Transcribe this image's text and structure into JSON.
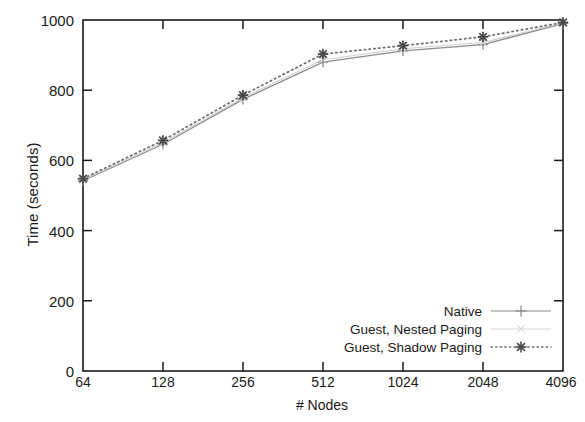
{
  "chart_data": {
    "type": "line",
    "title": "",
    "xlabel": "# Nodes",
    "ylabel": "Time (seconds)",
    "x_scale": "log2",
    "categories": [
      "64",
      "128",
      "256",
      "512",
      "1024",
      "2048",
      "4096"
    ],
    "x": [
      64,
      128,
      256,
      512,
      1024,
      2048,
      4096
    ],
    "xlim": [
      64,
      4096
    ],
    "ylim": [
      0,
      1000
    ],
    "yticks": [
      "0",
      "200",
      "400",
      "600",
      "800",
      "1000"
    ],
    "ytick_values": [
      0,
      200,
      400,
      600,
      800,
      1000
    ],
    "xticks": [
      "64",
      "128",
      "256",
      "512",
      "1024",
      "2048",
      "4096"
    ],
    "grid": false,
    "legend_position": "bottom-right",
    "series": [
      {
        "name": "Native",
        "values": [
          542,
          646,
          774,
          880,
          912,
          930,
          990
        ],
        "line_style": "solid",
        "marker": "plus",
        "color": "#8c8c8c"
      },
      {
        "name": "Guest, Nested Paging",
        "values": [
          545,
          650,
          779,
          887,
          918,
          936,
          992
        ],
        "line_style": "solid-faint",
        "marker": "cross",
        "color": "#cfcfcf"
      },
      {
        "name": "Guest, Shadow Paging",
        "values": [
          548,
          657,
          786,
          903,
          927,
          952,
          993
        ],
        "line_style": "dotted",
        "marker": "star",
        "color": "#6e6e6e"
      }
    ]
  },
  "axes": {
    "y_title": "Time (seconds)",
    "x_title": "# Nodes"
  },
  "legend": {
    "entries": [
      {
        "label": "Native"
      },
      {
        "label": "Guest, Nested Paging"
      },
      {
        "label": "Guest, Shadow Paging"
      }
    ]
  },
  "colors": {
    "axis": "#1a1a1a",
    "native": "#8c8c8c",
    "nested": "#cfcfcf",
    "shadow": "#6e6e6e",
    "background": "#ffffff"
  }
}
